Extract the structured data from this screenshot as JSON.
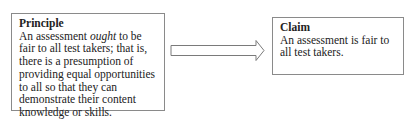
{
  "principle": {
    "title": "Principle",
    "text_before": "An assessment ",
    "text_emphasis": "ought",
    "text_after": " to be fair to all test takers; that is, there is a presumption of providing equal opportunities to all so that they can demonstrate their content knowledge or skills."
  },
  "arrow": {
    "direction": "right",
    "stroke_color": "#7a7a7a"
  },
  "claim": {
    "title": "Claim",
    "text": "An assessment is fair to all test takers."
  }
}
